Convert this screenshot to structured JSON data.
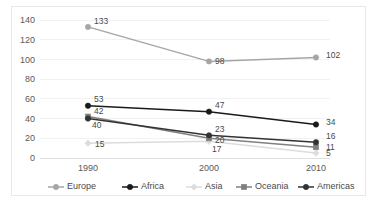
{
  "chart_data": {
    "type": "line",
    "title": "",
    "subtitle": "",
    "xlabel": "",
    "ylabel": "",
    "categories": [
      "1990",
      "2000",
      "2010"
    ],
    "x": [
      1990,
      2000,
      2010
    ],
    "ylim": [
      0,
      140
    ],
    "yticks": [
      0,
      20,
      40,
      60,
      80,
      100,
      120,
      140
    ],
    "ytick_labels": [
      "0",
      "20",
      "40",
      "60",
      "80",
      "100",
      "120",
      "140"
    ],
    "grid": true,
    "grid_axis": "y",
    "legend_position": "bottom",
    "series": [
      {
        "name": "Europe",
        "values": [
          133,
          98,
          102
        ],
        "labels": [
          "133",
          "98",
          "102"
        ],
        "color": "#a6a6a6",
        "marker": "circle"
      },
      {
        "name": "Africa",
        "values": [
          53,
          47,
          34
        ],
        "labels": [
          "53",
          "47",
          "34"
        ],
        "color": "#1a1a1a",
        "marker": "circle"
      },
      {
        "name": "Asia",
        "values": [
          15,
          17,
          5
        ],
        "labels": [
          "15",
          "17",
          "5"
        ],
        "color": "#dcdcdc",
        "marker": "diamond"
      },
      {
        "name": "Oceania",
        "values": [
          42,
          20,
          11
        ],
        "labels": [
          "42",
          "20",
          "11"
        ],
        "color": "#808080",
        "marker": "square"
      },
      {
        "name": "Americas",
        "values": [
          40,
          23,
          16
        ],
        "labels": [
          "40",
          "23",
          "16"
        ],
        "color": "#333333",
        "marker": "circle"
      }
    ]
  },
  "legend": {
    "items": [
      {
        "label": "Europe",
        "color": "#a6a6a6",
        "marker": "circle"
      },
      {
        "label": "Africa",
        "color": "#1a1a1a",
        "marker": "circle"
      },
      {
        "label": "Asia",
        "color": "#dcdcdc",
        "marker": "diamond"
      },
      {
        "label": "Oceania",
        "color": "#808080",
        "marker": "square"
      },
      {
        "label": "Americas",
        "color": "#333333",
        "marker": "circle"
      }
    ]
  },
  "frame": {
    "border_color": "#e8e8e8",
    "background": "#ffffff"
  }
}
